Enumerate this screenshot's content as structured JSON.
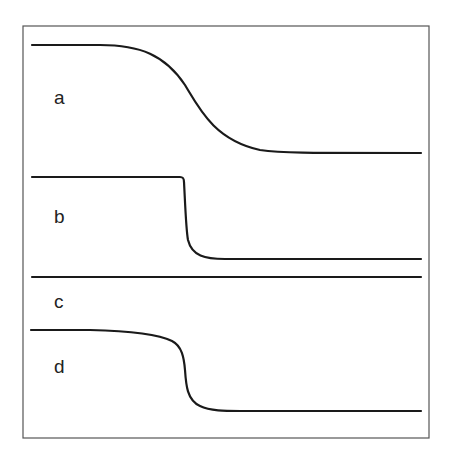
{
  "figure": {
    "frame": {
      "x": 23,
      "y": 26,
      "width": 406,
      "height": 412,
      "color": "#555555"
    },
    "line_color": "#1a1a1a",
    "traces": [
      {
        "label": "a",
        "label_pos": {
          "x": 54,
          "y": 104
        },
        "description": "gradual sigmoid decrease from high to low plateau",
        "path": "M32,45 L100,45 C140,45 165,55 185,85 C200,110 215,140 260,150 C280,153 300,153 421,153"
      },
      {
        "label": "b",
        "label_pos": {
          "x": 54,
          "y": 223
        },
        "description": "flat then abrupt near-vertical drop to low plateau",
        "path": "M32,177 L180,177 C183,177 184,178 184,182 C185,200 186,230 188,240 C192,256 205,259 225,259 L421,259"
      },
      {
        "label": "c",
        "label_pos": {
          "x": 54,
          "y": 308
        },
        "description": "flat horizontal line, no change",
        "path": "M32,277 L421,277"
      },
      {
        "label": "d",
        "label_pos": {
          "x": 54,
          "y": 373
        },
        "description": "slow decline then steep drop to low plateau",
        "path": "M31,330 L90,330 C130,331 160,335 172,341 C182,346 184,358 185,370 C186,385 187,400 200,406 C210,411 225,411 240,411 L421,411"
      }
    ]
  }
}
